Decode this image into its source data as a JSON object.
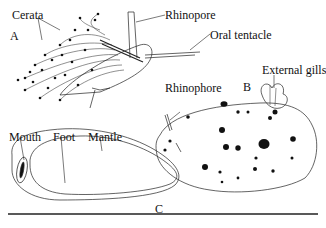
{
  "figure": {
    "panels": [
      {
        "id": "A",
        "label": "A",
        "description": "Aeolid nudibranch with cerata"
      },
      {
        "id": "B",
        "label": "B",
        "description": "Dorid nudibranch, dorsal view"
      },
      {
        "id": "C",
        "label": "C",
        "description": "Ventral view showing foot"
      }
    ],
    "labels": {
      "cerata": "Cerata",
      "rhinopore": "Rhinopore",
      "oral_tentacle": "Oral tentacle",
      "external_gills": "External gills",
      "rhinophore": "Rhinophore",
      "mouth": "Mouth",
      "foot": "Foot",
      "mantle": "Mantle"
    },
    "colors": {
      "ink": "#111111",
      "background": "#ffffff",
      "rule": "#222222"
    }
  }
}
